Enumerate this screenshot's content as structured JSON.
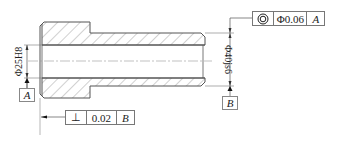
{
  "drawing": {
    "type": "sectioned sleeve/bushing technical drawing",
    "colors": {
      "line": "#555555",
      "hatch": "#888888",
      "text": "#222222"
    }
  },
  "dimensions": {
    "bore": {
      "symbol": "Φ",
      "value": "25H8",
      "label": "Φ25H8"
    },
    "outer": {
      "symbol": "Φ",
      "value": "40js6",
      "label": "Φ40js6"
    }
  },
  "datums": {
    "a": {
      "letter": "A"
    },
    "b": {
      "letter": "B"
    }
  },
  "tolerances": {
    "concentricity": {
      "symbol_name": "concentricity-icon",
      "symbol": "◎",
      "value": "Φ0.06",
      "datum": "A"
    },
    "perpendicularity": {
      "symbol_name": "perpendicularity-icon",
      "symbol": "⊥",
      "value": "0.02",
      "datum": "B"
    }
  }
}
